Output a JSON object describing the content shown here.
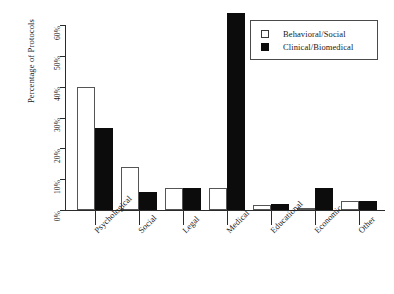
{
  "chart_data": {
    "type": "bar",
    "title": "",
    "xlabel": "",
    "ylabel": "Percentage of Protocols",
    "ylim": [
      0,
      60
    ],
    "ytick_labels": [
      "0%",
      "10%",
      "20%",
      "30%",
      "40%",
      "50%",
      "60%"
    ],
    "ytick_values": [
      0,
      10,
      20,
      30,
      40,
      50,
      60
    ],
    "grid": false,
    "legend_position": "top-right",
    "categories": [
      "Psychological",
      "Social",
      "Legal",
      "Medical",
      "Educational",
      "Economic",
      "Other"
    ],
    "series": [
      {
        "name": "Behavioral/Social",
        "color": "#ffffff",
        "values": [
          40,
          14,
          7,
          7,
          1.5,
          0.3,
          3
        ]
      },
      {
        "name": "Clinical/Biomedical",
        "color": "#0c0c0c",
        "values": [
          26.5,
          6,
          7,
          64,
          2,
          7,
          3
        ]
      }
    ]
  },
  "legend": {
    "entries": [
      {
        "label": "Behavioral/Social",
        "swatch": "light-square-icon"
      },
      {
        "label": "Clinical/Biomedical",
        "swatch": "dark-square-icon"
      }
    ]
  }
}
